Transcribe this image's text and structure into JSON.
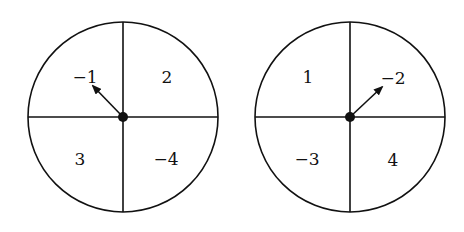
{
  "spinners": [
    {
      "name": "left",
      "center": [
        123,
        117
      ],
      "radius": 95,
      "sections": {
        "top_left": "−1",
        "top_right": "2",
        "bottom_left": "3",
        "bottom_right": "−4"
      },
      "arrow_points_to": "top_left"
    },
    {
      "name": "right",
      "center": [
        350,
        117
      ],
      "radius": 95,
      "sections": {
        "top_left": "1",
        "top_right": "−2",
        "bottom_left": "−3",
        "bottom_right": "4"
      },
      "arrow_points_to": "top_right"
    }
  ],
  "colors": {
    "stroke": "#111111",
    "background": "#ffffff"
  }
}
